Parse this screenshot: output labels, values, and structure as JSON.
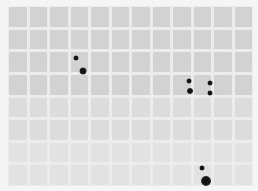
{
  "image": {
    "description": "Grayscale dot-blot / protein array membrane scan",
    "grid": {
      "columns": 12,
      "rows": 8
    },
    "colors": {
      "background": "#f5f5f5",
      "cell": "#d2d2d2",
      "gap": "#ececec",
      "spot": "#111111"
    },
    "spots": [
      {
        "x": 76,
        "y": 58,
        "size": 5
      },
      {
        "x": 83,
        "y": 71,
        "size": 7
      },
      {
        "x": 189,
        "y": 81,
        "size": 5
      },
      {
        "x": 190,
        "y": 91,
        "size": 6
      },
      {
        "x": 210,
        "y": 83,
        "size": 5
      },
      {
        "x": 210,
        "y": 93,
        "size": 5
      },
      {
        "x": 202,
        "y": 168,
        "size": 5
      },
      {
        "x": 206,
        "y": 181,
        "size": 10
      }
    ]
  }
}
